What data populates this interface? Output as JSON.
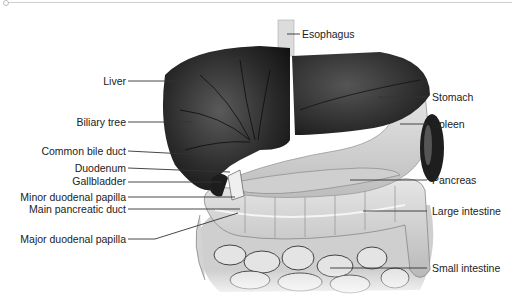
{
  "diagram": {
    "labels_left": [
      {
        "id": "liver",
        "text": "Liver"
      },
      {
        "id": "biliary-tree",
        "text": "Biliary tree"
      },
      {
        "id": "common-bile-duct",
        "text": "Common bile duct"
      },
      {
        "id": "duodenum",
        "text": "Duodenum"
      },
      {
        "id": "gallbladder",
        "text": "Gallbladder"
      },
      {
        "id": "minor-duodenal-papilla",
        "text": "Minor duodenal papilla"
      },
      {
        "id": "main-pancreatic-duct",
        "text": "Main pancreatic duct"
      },
      {
        "id": "major-duodenal-papilla",
        "text": "Major duodenal papilla"
      }
    ],
    "labels_right": [
      {
        "id": "esophagus",
        "text": "Esophagus"
      },
      {
        "id": "stomach",
        "text": "Stomach"
      },
      {
        "id": "spleen",
        "text": "Spleen"
      },
      {
        "id": "pancreas",
        "text": "Pancreas"
      },
      {
        "id": "large-intestine",
        "text": "Large intestine"
      },
      {
        "id": "small-intestine",
        "text": "Small intestine"
      }
    ],
    "colors": {
      "organ_dark": "#2a2a2a",
      "organ_light": "#d9d9d9",
      "leader_line": "#333333",
      "text": "#222222"
    }
  }
}
